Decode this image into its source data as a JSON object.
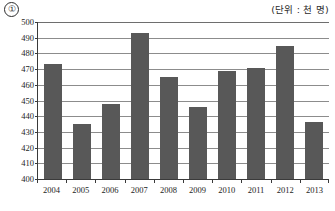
{
  "figure": {
    "marker": "①",
    "unit_label": "(단위 : 천 명)"
  },
  "chart_data": {
    "type": "bar",
    "title": "",
    "xlabel": "",
    "ylabel": "",
    "unit": "천 명",
    "categories": [
      "2004",
      "2005",
      "2006",
      "2007",
      "2008",
      "2009",
      "2010",
      "2011",
      "2012",
      "2013"
    ],
    "values": [
      473,
      435,
      448,
      493,
      465,
      446,
      469,
      471,
      485,
      436
    ],
    "ylim": [
      400,
      500
    ],
    "yticks": [
      400,
      410,
      420,
      430,
      440,
      450,
      460,
      470,
      480,
      490,
      500
    ],
    "ytick_labels": [
      "400",
      "410",
      "420",
      "430",
      "440",
      "450",
      "460",
      "470",
      "480",
      "490",
      "500"
    ],
    "grid": true,
    "legend": null,
    "bar_color": "#585858",
    "axis_color": "#3a3a3a",
    "grid_color": "#8c8c8c"
  }
}
